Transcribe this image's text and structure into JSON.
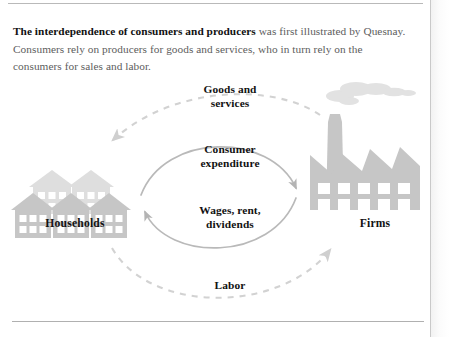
{
  "caption": {
    "lead": "The interdependence of consumers and producers",
    "rest": " was first illustrated by Quesnay. Consumers rely on producers for goods and services, who in turn rely on the consumers for sales and labor."
  },
  "diagram": {
    "type": "circular-flow",
    "nodes": [
      {
        "id": "households",
        "label": "Households",
        "icon": "houses-icon",
        "side": "left"
      },
      {
        "id": "firms",
        "label": "Firms",
        "icon": "factory-icon",
        "side": "right"
      }
    ],
    "flows": [
      {
        "id": "goods",
        "label": "Goods and\nservices",
        "from": "firms",
        "to": "households",
        "style": "dashed",
        "position": "outer-top"
      },
      {
        "id": "expenditure",
        "label": "Consumer\nexpenditure",
        "from": "households",
        "to": "firms",
        "style": "solid",
        "position": "inner-top"
      },
      {
        "id": "wages",
        "label": "Wages, rent,\ndividends",
        "from": "firms",
        "to": "households",
        "style": "solid",
        "position": "inner-bottom"
      },
      {
        "id": "labor",
        "label": "Labor",
        "from": "households",
        "to": "firms",
        "style": "dashed",
        "position": "outer-bottom"
      }
    ]
  },
  "colors": {
    "icon_fill": "#c6c6c6",
    "icon_fill_back": "#dcdcdc",
    "arrow_solid": "#b4b4b4",
    "arrow_dashed": "#d2d2d2",
    "text": "#121212",
    "caption_text": "#5d5d5d",
    "rule": "#b9b9b9",
    "background": "#ffffff"
  }
}
